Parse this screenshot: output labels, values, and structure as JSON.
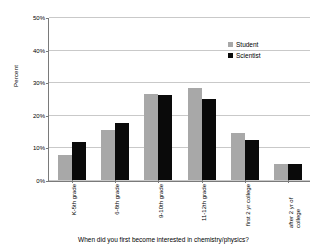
{
  "chart_data": {
    "type": "bar",
    "title": "",
    "caption": "When did you first become interested in chemistry/physics?",
    "xlabel": "",
    "ylabel": "Percent",
    "ylim": [
      0,
      50
    ],
    "ytick_labels": [
      "0%",
      "10%",
      "20%",
      "30%",
      "40%",
      "50%"
    ],
    "ytick_values": [
      0,
      10,
      20,
      30,
      40,
      50
    ],
    "grid": true,
    "legend_position": "top-right",
    "categories": [
      "K-5th grade",
      "6-8th grade",
      "9-10th grade",
      "11-12th grade",
      "first 2 yr college",
      "after 2 yr of college"
    ],
    "series": [
      {
        "name": "Student",
        "color": "#a8a8a8",
        "values": [
          7.6,
          15.5,
          26.6,
          28.4,
          14.6,
          4.8
        ]
      },
      {
        "name": "Scientist",
        "color": "#0a0a0a",
        "values": [
          11.6,
          17.7,
          26.2,
          25.0,
          12.5,
          4.8
        ]
      }
    ]
  },
  "legend": {
    "items": [
      {
        "label": "Student"
      },
      {
        "label": "Scientist"
      }
    ]
  }
}
